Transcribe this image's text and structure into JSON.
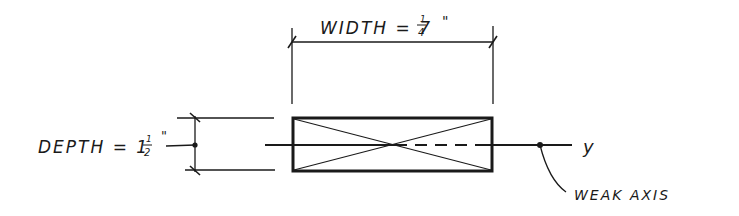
{
  "diagram": {
    "width_label": {
      "prefix": "WIDTH = 7",
      "frac_num": "1",
      "frac_den": "4",
      "unit": "\""
    },
    "depth_label": {
      "prefix": "DEPTH = 1",
      "frac_num": "1",
      "frac_den": "2",
      "unit": "\""
    },
    "axis_label": "y",
    "callout_label": "WEAK AXIS",
    "colors": {
      "ink": "#1a1a1a",
      "background": "#ffffff"
    }
  }
}
